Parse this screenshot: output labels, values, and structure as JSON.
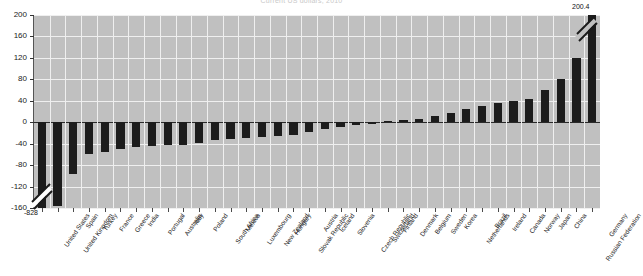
{
  "chart_data": {
    "type": "bar",
    "title": "Current US dollars, 2010",
    "xlabel": "",
    "ylabel": "",
    "ylim": [
      -160,
      200
    ],
    "yticks": [
      200,
      160,
      120,
      80,
      40,
      0,
      -40,
      -80,
      -120,
      -160
    ],
    "grid": true,
    "legend": null,
    "axis_break": true,
    "categories": [
      "United States",
      "United Kingdom",
      "Spain",
      "Turkey",
      "France",
      "Greece",
      "India",
      "Portugal",
      "Australia",
      "Italy",
      "Poland",
      "South Africa",
      "Mexico",
      "Luxembourg",
      "New Zealand",
      "Hungary",
      "Slovak Republic",
      "Austria",
      "Iceland",
      "Slovenia",
      "Czech Republic",
      "Switzerland",
      "Finland",
      "Denmark",
      "Belgium",
      "Sweden",
      "Korea",
      "Netherlands",
      "Brazil",
      "Ireland",
      "Canada",
      "Norway",
      "Japan",
      "China",
      "Russian Federation",
      "Germany"
    ],
    "values": [
      -828,
      -156,
      -96,
      -59,
      -55,
      -50,
      -47,
      -45,
      -43,
      -42,
      -38,
      -34,
      -31,
      -29,
      -27,
      -25,
      -23,
      -18,
      -12,
      -8,
      -6,
      -4,
      2,
      4,
      6,
      12,
      18,
      24,
      30,
      36,
      40,
      44,
      60,
      80,
      120,
      200.4
    ],
    "annotations": [
      {
        "name": "min-value-label",
        "text": "-828",
        "category": "United States"
      },
      {
        "name": "max-value-label",
        "text": "200.4",
        "category": "Germany"
      }
    ]
  },
  "axis": {
    "y_tick_labels": [
      "200",
      "160",
      "120",
      "80",
      "40",
      "0",
      "-40",
      "-80",
      "-120",
      "-160"
    ]
  }
}
